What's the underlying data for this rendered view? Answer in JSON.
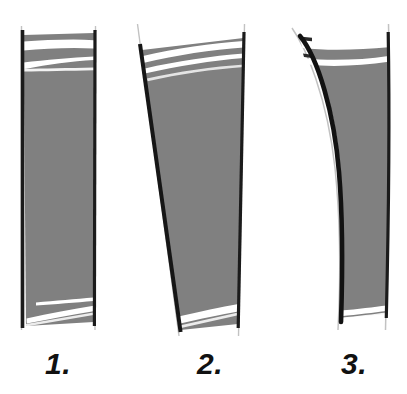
{
  "figure": {
    "background_color": "#ffffff",
    "width": 407,
    "height": 394,
    "caption_labels": [
      {
        "text": "1.",
        "name": "panel-label-1"
      },
      {
        "text": "2.",
        "name": "panel-label-2"
      },
      {
        "text": "3.",
        "name": "panel-label-3"
      }
    ],
    "palette": {
      "fill_gray": "#808080",
      "fill_gray_light": "#8c8c8c",
      "outline_dark": "#1a1a1a",
      "outline_faint": "#b9b9b9",
      "streak_white": "#ffffff"
    }
  },
  "panels": [
    {
      "id": 1,
      "label": "1.",
      "description": "near-vertical column, slightly tapering toward the base",
      "left_edge": "straight-vertical",
      "right_edge": "straight-vertical",
      "top_bands": 2,
      "bottom_bands": 2
    },
    {
      "id": 2,
      "label": "2.",
      "description": "wedge widest at the top, narrowing strongly toward the base",
      "left_edge": "straight-oblique",
      "right_edge": "straight-near-vertical",
      "top_bands": 2,
      "bottom_bands": 1
    },
    {
      "id": 3,
      "label": "3.",
      "description": "concave column with a strongly curved, inward-bowed left edge",
      "left_edge": "concave-curved",
      "right_edge": "slightly-curved",
      "top_bands": 2,
      "bottom_bands": 1
    }
  ]
}
